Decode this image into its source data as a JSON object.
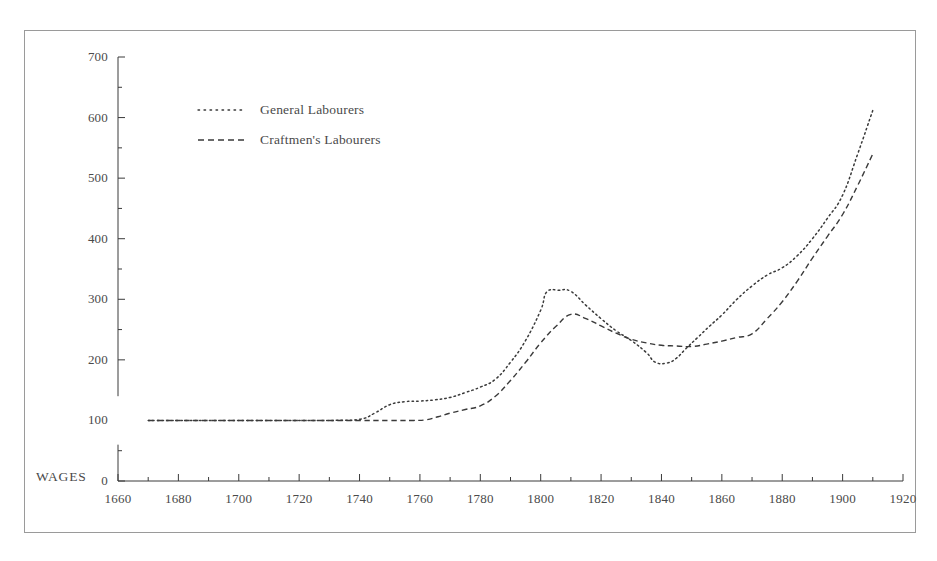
{
  "figure": {
    "background_color": "#ffffff",
    "frame_color": "#9a9a9a",
    "ink_color": "#3a3a3a"
  },
  "axis": {
    "y_title": "WAGES",
    "y_ticks": [
      "0",
      "100",
      "200",
      "300",
      "400",
      "500",
      "600",
      "700"
    ],
    "x_ticks": [
      "1660",
      "1680",
      "1700",
      "1720",
      "1740",
      "1760",
      "1780",
      "1800",
      "1820",
      "1840",
      "1860",
      "1880",
      "1900",
      "1920"
    ]
  },
  "legend": {
    "items": [
      {
        "label": "General Labourers",
        "style": "dotted"
      },
      {
        "label": "Craftmen's Labourers",
        "style": "dashed"
      }
    ]
  },
  "chart_data": {
    "type": "line",
    "title": "",
    "xlabel": "",
    "ylabel": "WAGES",
    "xlim": [
      1660,
      1920
    ],
    "ylim": [
      0,
      700
    ],
    "xticks": [
      1660,
      1680,
      1700,
      1720,
      1740,
      1760,
      1780,
      1800,
      1820,
      1840,
      1860,
      1880,
      1900,
      1920
    ],
    "yticks": [
      0,
      100,
      200,
      300,
      400,
      500,
      600,
      700
    ],
    "minor_xtick_step": 10,
    "minor_ytick_step": 50,
    "grid": false,
    "legend_position": "upper-left-inside",
    "series": [
      {
        "name": "General Labourers",
        "style": "dotted",
        "color": "#3a3a3a",
        "x": [
          1670,
          1690,
          1710,
          1730,
          1740,
          1745,
          1750,
          1755,
          1760,
          1765,
          1770,
          1775,
          1780,
          1785,
          1790,
          1795,
          1800,
          1802,
          1806,
          1810,
          1815,
          1820,
          1825,
          1830,
          1835,
          1838,
          1842,
          1845,
          1848,
          1852,
          1856,
          1860,
          1865,
          1870,
          1875,
          1880,
          1885,
          1890,
          1895,
          1900,
          1905,
          1910
        ],
        "y": [
          100,
          100,
          100,
          100,
          102,
          112,
          126,
          131,
          132,
          134,
          138,
          146,
          155,
          168,
          196,
          232,
          282,
          312,
          315,
          313,
          290,
          268,
          248,
          232,
          212,
          196,
          195,
          203,
          218,
          237,
          256,
          274,
          300,
          322,
          340,
          352,
          372,
          400,
          434,
          472,
          540,
          612
        ],
        "ylim_note": "values read off left axis"
      },
      {
        "name": "Craftmen's Labourers",
        "style": "dashed",
        "color": "#3a3a3a",
        "x": [
          1670,
          1690,
          1710,
          1730,
          1740,
          1750,
          1758,
          1762,
          1766,
          1770,
          1775,
          1780,
          1785,
          1790,
          1795,
          1800,
          1805,
          1810,
          1815,
          1820,
          1825,
          1830,
          1835,
          1840,
          1845,
          1850,
          1855,
          1860,
          1865,
          1870,
          1875,
          1880,
          1885,
          1890,
          1895,
          1900,
          1905,
          1910
        ],
        "y": [
          100,
          100,
          100,
          100,
          100,
          100,
          100,
          101,
          106,
          112,
          118,
          124,
          140,
          166,
          196,
          228,
          255,
          275,
          268,
          256,
          244,
          234,
          228,
          224,
          223,
          222,
          226,
          231,
          237,
          243,
          268,
          296,
          330,
          368,
          404,
          440,
          488,
          540
        ],
        "ylim_note": "values read off left axis"
      }
    ]
  }
}
